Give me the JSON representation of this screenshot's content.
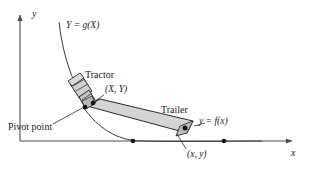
{
  "figure": {
    "background": "#ffffff",
    "stroke_color": "#1a1a1a",
    "trailer_fill": "#d0d0d0",
    "tractor_fill": "#c8c8c8",
    "axis_color": "#4d4d4d",
    "width": 309,
    "height": 179
  },
  "axes": {
    "x_label": "x",
    "y_label": "y",
    "origin": {
      "x": 20,
      "y": 141
    },
    "x_end": {
      "x": 295,
      "y": 141
    },
    "y_end": {
      "x": 20,
      "y": 12
    }
  },
  "curves": [
    {
      "name": "tractor-path-curve",
      "label": "Y = g(X)",
      "label_pos": {
        "x": 66,
        "y": 25
      },
      "path": "M 59,22 C 62,48 68,70 79,92"
    },
    {
      "name": "trailer-path-curve",
      "label": "y = f(x)",
      "label_pos": {
        "x": 196,
        "y": 120
      },
      "path": "M 82,108 C 100,130 118,140 140,141 C 180,142 230,141 262,141"
    }
  ],
  "shapes": {
    "tractor": {
      "label": "Tractor",
      "label_pos": {
        "x": 87,
        "y": 74
      },
      "body": "71,83 83,76 92,93 80,100",
      "cab": "78,96 88,90 95,102 85,108",
      "detail_lines": [
        "M 74,85 L 86,78",
        "M 77,90 L 89,83",
        "M 81,98 L 91,92"
      ]
    },
    "trailer": {
      "label": "Trailer",
      "label_pos": {
        "x": 163,
        "y": 110
      },
      "body": "87,106 100,99 193,121 188,133"
    }
  },
  "annotations": [
    {
      "name": "tractor-coordinate-label",
      "text": "(X, Y)",
      "pos": {
        "x": 106,
        "y": 89
      },
      "leader": "M 105,95 L 91,104"
    },
    {
      "name": "trailer-coordinate-label",
      "text": "(x, y)",
      "pos": {
        "x": 188,
        "y": 152
      },
      "leader": "M 187,150 L 177,135"
    },
    {
      "name": "pivot-point-label",
      "text": "Pivot point",
      "pos": {
        "x": 10,
        "y": 126
      },
      "leader": "M 55,125 L 84,107"
    }
  ],
  "markers": [
    {
      "name": "pivot-point-marker",
      "x": 85,
      "y": 107,
      "r": 2.2
    },
    {
      "name": "hitch-point-marker",
      "x": 92,
      "y": 104,
      "r": 2.2
    },
    {
      "name": "trailer-rear-marker",
      "x": 186,
      "y": 127,
      "r": 2.4
    },
    {
      "name": "axis-marker-left",
      "x": 133,
      "y": 141,
      "r": 2.2
    },
    {
      "name": "axis-marker-right",
      "x": 224,
      "y": 141,
      "r": 2.2
    }
  ]
}
